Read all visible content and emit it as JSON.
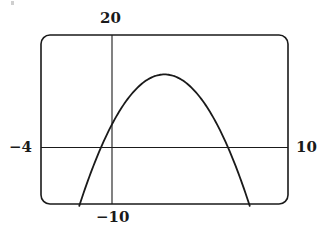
{
  "chart_data": {
    "type": "line",
    "title": "",
    "xlabel": "",
    "ylabel": "",
    "function": "y = -x^2 + 6x + 4",
    "xlim": [
      -4,
      10
    ],
    "ylim": [
      -10,
      20
    ],
    "grid": false,
    "legend": null,
    "window_labels": {
      "xmin": "−4",
      "xmax": "10",
      "ymin": "−10",
      "ymax": "20"
    },
    "series": [
      {
        "name": "parabola",
        "x": [
          -1.83,
          -1,
          0,
          1,
          2,
          3,
          4,
          5,
          6,
          7,
          7.83
        ],
        "y": [
          -10,
          -3,
          4,
          9,
          12,
          13,
          12,
          9,
          4,
          -3,
          -10
        ]
      }
    ],
    "key_points": {
      "vertex": [
        3,
        13
      ],
      "y_intercept": [
        0,
        4
      ],
      "x_intercepts": [
        -0.61,
        6.61
      ]
    },
    "colors": {
      "line": "#1a1a1a",
      "frame": "#1a1a1a",
      "background": "#ffffff"
    }
  },
  "labels": {
    "ymax": "20",
    "ymin": "−10",
    "xmin": "−4",
    "xmax": "10"
  }
}
